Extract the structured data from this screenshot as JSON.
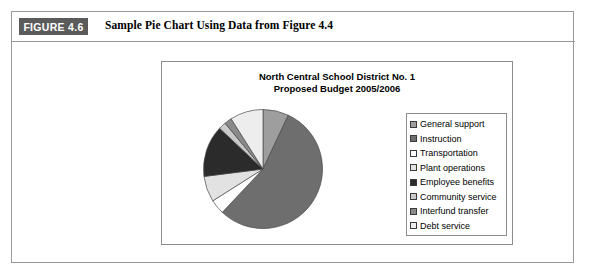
{
  "figure": {
    "badge_label": "FIGURE 4.6",
    "caption": "Sample Pie Chart Using Data from Figure 4.4"
  },
  "chart_data": {
    "type": "pie",
    "title": "North Central School District No. 1",
    "subtitle": "Proposed Budget 2005/2006",
    "title_lines": [
      "North Central School District No. 1",
      "Proposed Budget 2005/2006"
    ],
    "legend_position": "right",
    "start_angle_deg": 0,
    "direction": "clockwise",
    "categories": [
      "General support",
      "Instruction",
      "Transportation",
      "Plant operations",
      "Employee benefits",
      "Community service",
      "Interfund transfer",
      "Debt service"
    ],
    "values": [
      7,
      55,
      4,
      7,
      14,
      2,
      2,
      9
    ],
    "unit": "percent",
    "colors": [
      "#9e9e9e",
      "#6e6e6e",
      "#ffffff",
      "#e2e2e2",
      "#2b2b2b",
      "#c9c9c9",
      "#8a8a8a",
      "#ededed"
    ],
    "slices": [
      {
        "label": "General support",
        "value": 7,
        "color": "#9e9e9e"
      },
      {
        "label": "Instruction",
        "value": 55,
        "color": "#6e6e6e"
      },
      {
        "label": "Transportation",
        "value": 4,
        "color": "#ffffff"
      },
      {
        "label": "Plant operations",
        "value": 7,
        "color": "#e2e2e2"
      },
      {
        "label": "Employee benefits",
        "value": 14,
        "color": "#2b2b2b"
      },
      {
        "label": "Community service",
        "value": 2,
        "color": "#c9c9c9"
      },
      {
        "label": "Interfund transfer",
        "value": 2,
        "color": "#8a8a8a"
      },
      {
        "label": "Debt service",
        "value": 9,
        "color": "#ededed"
      }
    ]
  }
}
